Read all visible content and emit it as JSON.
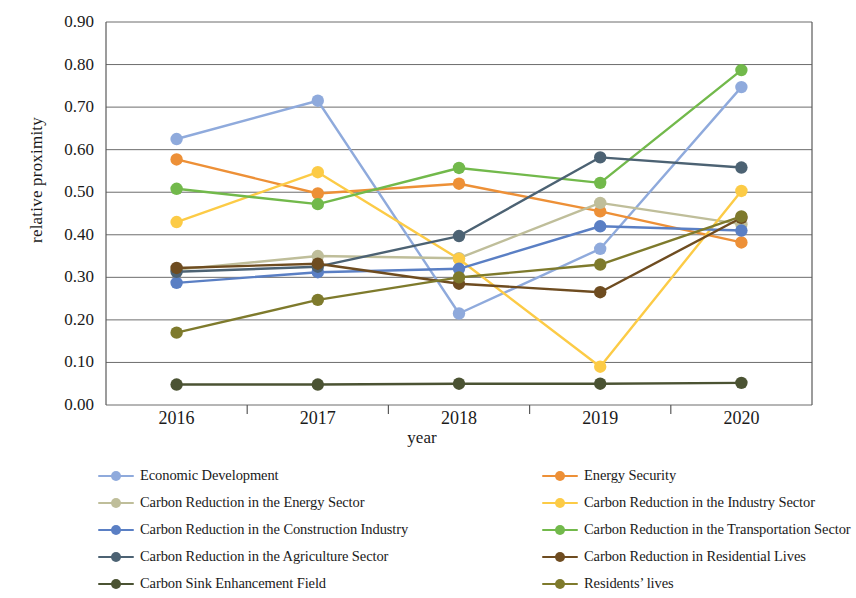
{
  "chart_data": {
    "type": "line",
    "title": "",
    "xlabel": "year",
    "ylabel": "relative proximity",
    "categories": [
      "2016",
      "2017",
      "2018",
      "2019",
      "2020"
    ],
    "x": [
      2016,
      2017,
      2018,
      2019,
      2020
    ],
    "ylim": [
      0.0,
      0.9
    ],
    "ytick_labels": [
      "0.00",
      "0.10",
      "0.20",
      "0.30",
      "0.40",
      "0.50",
      "0.60",
      "0.70",
      "0.80",
      "0.90"
    ],
    "ytick_values": [
      0.0,
      0.1,
      0.2,
      0.3,
      0.4,
      0.5,
      0.6,
      0.7,
      0.8,
      0.9
    ],
    "grid": "horizontal",
    "legend_position": "bottom",
    "legend_columns": 2,
    "markers": "circle",
    "series": [
      {
        "name": "Economic Development",
        "color": "#8FAADC",
        "values": [
          0.625,
          0.715,
          0.215,
          0.367,
          0.747
        ]
      },
      {
        "name": "Energy Security",
        "color": "#ED9037",
        "values": [
          0.577,
          0.497,
          0.52,
          0.455,
          0.382
        ]
      },
      {
        "name": "Carbon Reduction in the Energy Sector",
        "color": "#BFBE9A",
        "values": [
          0.318,
          0.35,
          0.345,
          0.475,
          0.425
        ]
      },
      {
        "name": "Carbon Reduction in the Industry Sector",
        "color": "#FCCB46",
        "values": [
          0.43,
          0.547,
          0.343,
          0.09,
          0.503
        ]
      },
      {
        "name": "Carbon Reduction in the Construction Industry",
        "color": "#5A7FC4",
        "values": [
          0.287,
          0.312,
          0.32,
          0.42,
          0.41
        ]
      },
      {
        "name": "Carbon Reduction in the Transportation Sector",
        "color": "#72B94B",
        "values": [
          0.508,
          0.472,
          0.557,
          0.522,
          0.787
        ]
      },
      {
        "name": "Carbon Reduction in the Agriculture Sector",
        "color": "#4C6273",
        "values": [
          0.313,
          0.325,
          0.397,
          0.582,
          0.558
        ]
      },
      {
        "name": "Carbon Reduction in Residential Lives",
        "color": "#6E4C20",
        "values": [
          0.322,
          0.332,
          0.285,
          0.265,
          0.44
        ]
      },
      {
        "name": "Carbon Sink Enhancement Field",
        "color": "#4B5333",
        "values": [
          0.048,
          0.048,
          0.05,
          0.05,
          0.052
        ]
      },
      {
        "name": "Residents’  lives",
        "color": "#7E7A2C",
        "values": [
          0.17,
          0.247,
          0.3,
          0.33,
          0.443
        ]
      }
    ]
  },
  "legend": {
    "left_column": [
      {
        "label": "Economic Development",
        "color": "#8FAADC"
      },
      {
        "label": "Carbon Reduction in the Energy Sector",
        "color": "#BFBE9A"
      },
      {
        "label": "Carbon Reduction in the Construction Industry",
        "color": "#5A7FC4"
      },
      {
        "label": "Carbon Reduction in the Agriculture Sector",
        "color": "#4C6273"
      },
      {
        "label": "Carbon Sink Enhancement Field",
        "color": "#4B5333"
      }
    ],
    "right_column": [
      {
        "label": "Energy Security",
        "color": "#ED9037"
      },
      {
        "label": "Carbon Reduction in the Industry Sector",
        "color": "#FCCB46"
      },
      {
        "label": "Carbon Reduction in the Transportation Sector",
        "color": "#72B94B"
      },
      {
        "label": "Carbon Reduction in Residential Lives",
        "color": "#6E4C20"
      },
      {
        "label": "Residents’  lives",
        "color": "#7E7A2C"
      }
    ]
  },
  "axes": {
    "y_title": "relative proximity",
    "x_title": "year"
  }
}
